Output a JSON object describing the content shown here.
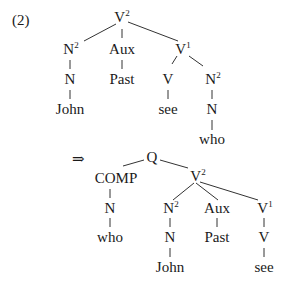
{
  "example_number": "(2)",
  "arrow": "⇒",
  "tree1": {
    "root": {
      "label": "V",
      "sup": "2"
    },
    "n2": {
      "label": "N",
      "sup": "2"
    },
    "n": "N",
    "john": "John",
    "aux": "Aux",
    "past": "Past",
    "v1": {
      "label": "V",
      "sup": "1"
    },
    "v": "V",
    "see": "see",
    "n2b": {
      "label": "N",
      "sup": "2"
    },
    "nb": "N",
    "who": "who"
  },
  "tree2": {
    "root": "Q",
    "comp": "COMP",
    "n_comp": "N",
    "who": "who",
    "v2": {
      "label": "V",
      "sup": "2"
    },
    "n2": {
      "label": "N",
      "sup": "2"
    },
    "n": "N",
    "john": "John",
    "aux": "Aux",
    "past": "Past",
    "v1": {
      "label": "V",
      "sup": "1"
    },
    "v": "V",
    "see": "see"
  }
}
